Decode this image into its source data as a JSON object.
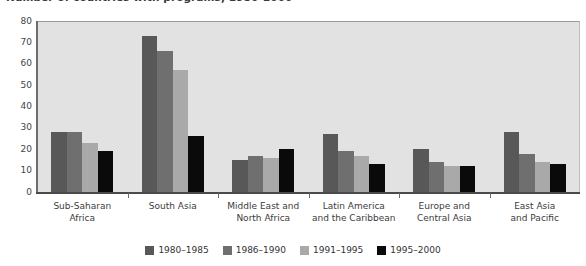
{
  "chart_data": {
    "type": "bar",
    "title": "Number of countries with programs, 1980-2000",
    "xlabel": "",
    "ylabel": "",
    "ylim": [
      0,
      80
    ],
    "yticks": [
      0,
      10,
      20,
      30,
      40,
      50,
      60,
      70,
      80
    ],
    "grid": false,
    "legend_position": "bottom",
    "categories": [
      "Sub-Saharan Africa",
      "South Asia",
      "Middle East and North Africa",
      "Latin America and the Caribbean",
      "Europe and Central Asia",
      "East Asia and Pacific"
    ],
    "category_lines": [
      [
        "Sub-Saharan",
        "Africa"
      ],
      [
        "South Asia"
      ],
      [
        "Middle East and",
        "North Africa"
      ],
      [
        "Latin America",
        "and the Caribbean"
      ],
      [
        "Europe and",
        "Central Asia"
      ],
      [
        "East Asia",
        "and Pacific"
      ]
    ],
    "series": [
      {
        "name": "1980–1985",
        "color": "#585858",
        "values": [
          28,
          73,
          15,
          27,
          20,
          28
        ]
      },
      {
        "name": "1986–1990",
        "color": "#6f6f6f",
        "values": [
          28,
          66,
          17,
          19,
          14,
          18
        ]
      },
      {
        "name": "1991–1995",
        "color": "#a9a9a9",
        "values": [
          23,
          57,
          16,
          17,
          12,
          14
        ]
      },
      {
        "name": "1995–2000",
        "color": "#0a0a0a",
        "values": [
          19,
          26,
          20,
          13,
          12,
          13
        ]
      }
    ]
  },
  "colors": {
    "plot_background": "#e2e2e2",
    "axis": "#4a4a4a",
    "text": "#3c3c3c"
  }
}
